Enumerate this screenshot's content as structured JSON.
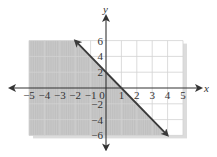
{
  "chart_data": {
    "type": "line",
    "title": "",
    "xlabel": "x",
    "ylabel": "y",
    "xlim": [
      -5,
      5
    ],
    "ylim": [
      -6,
      6
    ],
    "grid": true,
    "x_ticks": [
      -5,
      -4,
      -3,
      -2,
      -1,
      0,
      1,
      2,
      3,
      4,
      5
    ],
    "y_ticks": [
      -6,
      -4,
      -2,
      2,
      4,
      6
    ],
    "x_tick_labels": [
      "−5",
      "−4",
      "−3",
      "−2",
      "−1",
      "0",
      "1",
      "2",
      "3",
      "4",
      "5"
    ],
    "y_tick_labels": [
      "−6",
      "−4",
      "−2",
      "2",
      "4",
      "6"
    ],
    "series": [
      {
        "name": "boundary line",
        "equation": "y = -2x + 2",
        "style": "solid",
        "arrows": "both",
        "x": [
          -2,
          4
        ],
        "y": [
          6,
          -6
        ]
      }
    ],
    "shaded_region": {
      "inequality": "y ≤ -2x + 2",
      "side": "below-left of line"
    },
    "legend": null
  },
  "layout": {
    "origin_px": [
      106,
      88
    ],
    "x_unit_px": 15.4,
    "y_unit_px": 7.9,
    "colors": {
      "shade": "#c8c8c8",
      "shade_grid": "#b4b4b4",
      "grid": "#d2d2d2",
      "axis": "#333333",
      "line": "#3a3a3a",
      "shadow": "#dcdcdc"
    }
  }
}
